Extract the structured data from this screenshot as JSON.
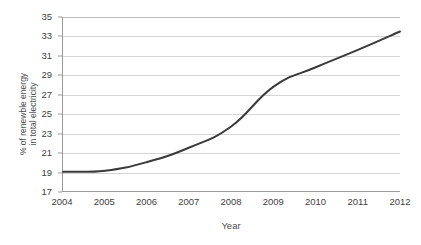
{
  "figure": {
    "background_color": "#ffffff",
    "title_remnant": "· · · ·· ·  ·· ·· ·· · ·· ·",
    "line_color": "#3a3a3a",
    "grid_color": "#d5d5d5",
    "axis_color": "#9a9a9a"
  },
  "chart_data": {
    "type": "line",
    "title": "",
    "xlabel": "Year",
    "ylabel": "% of renewble energy in total electricity",
    "ylabel_line1": "% of renewble energy",
    "ylabel_line2": "in total electricity",
    "categories": [
      "2004",
      "2005",
      "2006",
      "2007",
      "2008",
      "2009",
      "2010",
      "2011",
      "2012"
    ],
    "x": [
      2004,
      2005,
      2006,
      2007,
      2008,
      2009,
      2010,
      2011,
      2012
    ],
    "values": [
      19.0,
      19.1,
      20.0,
      21.5,
      23.7,
      27.8,
      29.8,
      31.6,
      33.5
    ],
    "series": [
      {
        "name": "% of renewble energy in total electricity",
        "values": [
          19.0,
          19.1,
          20.0,
          21.5,
          23.7,
          27.8,
          29.8,
          31.6,
          33.5
        ]
      }
    ],
    "ylim": [
      17,
      35
    ],
    "yticks": [
      35,
      33,
      31,
      29,
      27,
      25,
      23,
      21,
      19,
      17
    ],
    "xlim": [
      2004,
      2012
    ],
    "xticks": [
      "2004",
      "2005",
      "2006",
      "2007",
      "2008",
      "2009",
      "2010",
      "2011",
      "2012"
    ],
    "grid": "horizontal",
    "legend": "none",
    "markers": "none",
    "line_width": 2
  }
}
